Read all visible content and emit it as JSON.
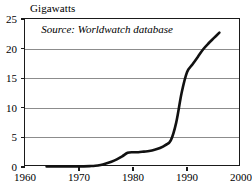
{
  "chart_data": {
    "type": "line",
    "title": "",
    "ylabel": "Gigawatts",
    "xlabel": "",
    "xlim": [
      1960,
      2000
    ],
    "ylim": [
      0,
      25
    ],
    "grid": "horizontal",
    "legend": "none",
    "annotations": [
      {
        "name": "source-note",
        "text": "Source: Worldwatch database",
        "style": "italic",
        "x": 1963,
        "y": 23.2
      }
    ],
    "x_ticks": [
      1960,
      1970,
      1980,
      1990,
      2000
    ],
    "x_tick_labels": [
      "1960",
      "1970",
      "1980",
      "1990",
      "2000"
    ],
    "y_ticks": [
      0,
      5,
      10,
      15,
      20,
      25
    ],
    "y_tick_labels": [
      "0",
      "5",
      "10",
      "15",
      "20",
      "25"
    ],
    "series": [
      {
        "name": "World wind energy generating capacity",
        "color": "#111111",
        "x": [
          1964,
          1966,
          1968,
          1970,
          1972,
          1973,
          1974,
          1975,
          1976,
          1977,
          1978,
          1979,
          1980,
          1981,
          1982,
          1983,
          1984,
          1985,
          1986,
          1987,
          1988,
          1989,
          1990,
          1991,
          1992,
          1993,
          1994,
          1995,
          1996
        ],
        "values": [
          0.1,
          0.1,
          0.1,
          0.1,
          0.15,
          0.2,
          0.35,
          0.6,
          0.9,
          1.3,
          1.8,
          2.4,
          2.5,
          2.5,
          2.6,
          2.7,
          2.9,
          3.2,
          3.7,
          4.5,
          7.5,
          12.5,
          16.0,
          17.3,
          18.6,
          19.9,
          20.9,
          21.8,
          22.7
        ]
      }
    ]
  },
  "colors": {
    "axis": "#1a1a1a",
    "gridline": "#8c8c8c",
    "line": "#111111",
    "background": "#ffffff"
  }
}
